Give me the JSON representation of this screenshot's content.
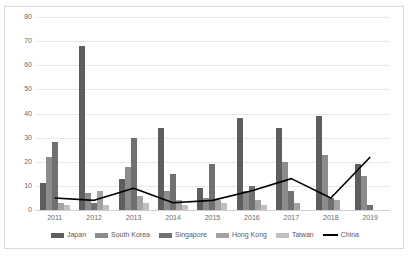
{
  "chart_data": {
    "type": "bar",
    "title": "",
    "subtitle": "",
    "xlabel": "",
    "ylabel": "",
    "categories": [
      "2011",
      "2012",
      "2013",
      "2014",
      "2015",
      "2016",
      "2017",
      "2018",
      "2019"
    ],
    "ylim": [
      0,
      80
    ],
    "yticks": [
      0,
      10,
      20,
      30,
      40,
      50,
      60,
      70,
      80
    ],
    "ytick_labels": [
      "0",
      "10",
      "20",
      "30",
      "40",
      "50",
      "60",
      "70",
      "80"
    ],
    "grid": true,
    "legend_position": "bottom",
    "series": [
      {
        "name": "Japan",
        "kind": "bar",
        "color": "#5e5e5e",
        "values": [
          11,
          68,
          13,
          34,
          9,
          38,
          34,
          39,
          19
        ]
      },
      {
        "name": "South Korea",
        "kind": "bar",
        "color": "#8c8c8c",
        "values": [
          22,
          7,
          18,
          8,
          5,
          8,
          20,
          23,
          14
        ]
      },
      {
        "name": "Singapore",
        "kind": "bar",
        "color": "#707070",
        "values": [
          28,
          3,
          30,
          15,
          19,
          10,
          8,
          5,
          2
        ]
      },
      {
        "name": "Hong Kong",
        "kind": "bar",
        "color": "#a3a3a3",
        "values": [
          3,
          8,
          6,
          4,
          4,
          4,
          3,
          4,
          0
        ]
      },
      {
        "name": "Taiwan",
        "kind": "bar",
        "color": "#bfbfbf",
        "values": [
          2,
          2,
          3,
          2,
          3,
          2,
          0,
          0,
          0
        ]
      },
      {
        "name": "China",
        "kind": "line",
        "color": "#000000",
        "values": [
          5,
          4,
          9,
          3,
          4,
          8,
          13,
          5,
          22
        ]
      }
    ]
  },
  "legend": {
    "items": [
      {
        "label": "Japan",
        "color": "#5e5e5e",
        "kind": "bar"
      },
      {
        "label": "South Korea",
        "color": "#8c8c8c",
        "kind": "bar"
      },
      {
        "label": "Singapore",
        "color": "#707070",
        "kind": "bar"
      },
      {
        "label": "Hong Kong",
        "color": "#a3a3a3",
        "kind": "bar"
      },
      {
        "label": "Taiwan",
        "color": "#bfbfbf",
        "kind": "bar"
      },
      {
        "label": "China",
        "color": "#000000",
        "kind": "line"
      }
    ]
  }
}
